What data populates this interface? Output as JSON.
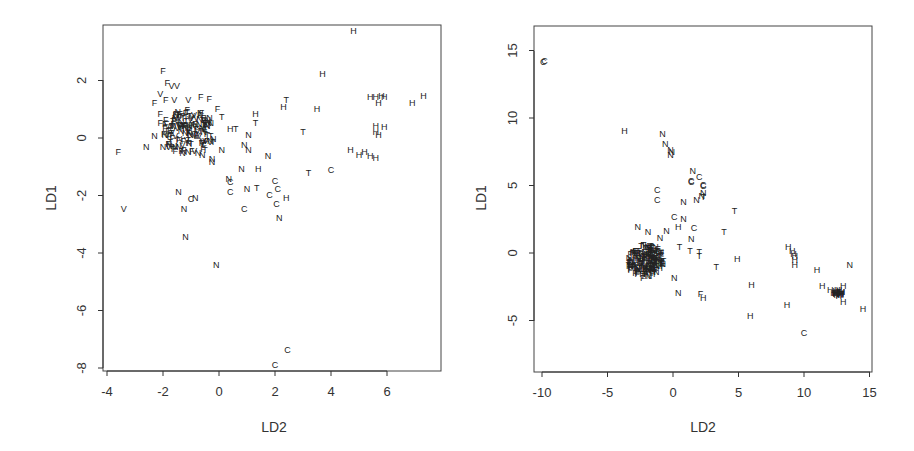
{
  "chart_data": [
    {
      "type": "scatter",
      "title": "",
      "xlabel": "LD2",
      "ylabel": "LD1",
      "xlim": [
        -4.3,
        7.8
      ],
      "ylim": [
        -8.1,
        3.9
      ],
      "xticks": [
        -4,
        -2,
        0,
        2,
        4,
        6
      ],
      "yticks": [
        -8,
        -6,
        -4,
        -2,
        0,
        2
      ],
      "grid": false,
      "legend": "none (points plotted as class letters)",
      "classes": [
        "C",
        "F",
        "H",
        "N",
        "T",
        "V"
      ],
      "points": [
        {
          "label": "H",
          "x": 4.8,
          "y": 3.7
        },
        {
          "label": "H",
          "x": 3.7,
          "y": 2.2
        },
        {
          "label": "T",
          "x": 2.4,
          "y": 1.3
        },
        {
          "label": "H",
          "x": 2.3,
          "y": 1.05
        },
        {
          "label": "H",
          "x": 3.5,
          "y": 1.0
        },
        {
          "label": "H",
          "x": 5.4,
          "y": 1.4
        },
        {
          "label": "H",
          "x": 5.6,
          "y": 1.4
        },
        {
          "label": "H",
          "x": 5.8,
          "y": 1.45
        },
        {
          "label": "H",
          "x": 5.9,
          "y": 1.4
        },
        {
          "label": "H",
          "x": 5.7,
          "y": 1.2
        },
        {
          "label": "H",
          "x": 6.9,
          "y": 1.2
        },
        {
          "label": "H",
          "x": 7.3,
          "y": 1.45
        },
        {
          "label": "H",
          "x": 5.6,
          "y": 0.4
        },
        {
          "label": "H",
          "x": 5.9,
          "y": 0.35
        },
        {
          "label": "H",
          "x": 5.6,
          "y": 0.2
        },
        {
          "label": "H",
          "x": 5.7,
          "y": 0.1
        },
        {
          "label": "H",
          "x": 4.7,
          "y": -0.45
        },
        {
          "label": "H",
          "x": 5.0,
          "y": -0.6
        },
        {
          "label": "H",
          "x": 5.2,
          "y": -0.5
        },
        {
          "label": "H",
          "x": 5.4,
          "y": -0.65
        },
        {
          "label": "H",
          "x": 5.6,
          "y": -0.7
        },
        {
          "label": "T",
          "x": 3.0,
          "y": 0.2
        },
        {
          "label": "T",
          "x": 3.2,
          "y": -1.25
        },
        {
          "label": "C",
          "x": 4.0,
          "y": -1.15
        },
        {
          "label": "H",
          "x": 1.3,
          "y": 0.8
        },
        {
          "label": "T",
          "x": 1.3,
          "y": 0.5
        },
        {
          "label": "H",
          "x": 0.4,
          "y": 0.3
        },
        {
          "label": "T",
          "x": 0.6,
          "y": 0.3
        },
        {
          "label": "N",
          "x": 1.05,
          "y": 0.1
        },
        {
          "label": "N",
          "x": 0.9,
          "y": -0.25
        },
        {
          "label": "N",
          "x": 1.05,
          "y": -0.45
        },
        {
          "label": "N",
          "x": 1.75,
          "y": -0.65
        },
        {
          "label": "N",
          "x": 0.8,
          "y": -1.1
        },
        {
          "label": "H",
          "x": 1.4,
          "y": -1.1
        },
        {
          "label": "N",
          "x": 0.35,
          "y": -1.45
        },
        {
          "label": "C",
          "x": 0.4,
          "y": -1.55
        },
        {
          "label": "C",
          "x": 0.4,
          "y": -1.9
        },
        {
          "label": "N",
          "x": 1.0,
          "y": -1.8
        },
        {
          "label": "T",
          "x": 1.35,
          "y": -1.75
        },
        {
          "label": "C",
          "x": 2.0,
          "y": -1.5
        },
        {
          "label": "C",
          "x": 2.1,
          "y": -1.8
        },
        {
          "label": "C",
          "x": 1.8,
          "y": -2.0
        },
        {
          "label": "H",
          "x": 2.4,
          "y": -2.1
        },
        {
          "label": "C",
          "x": 2.05,
          "y": -2.3
        },
        {
          "label": "C",
          "x": 0.9,
          "y": -2.5
        },
        {
          "label": "N",
          "x": 2.15,
          "y": -2.8
        },
        {
          "label": "N",
          "x": -1.45,
          "y": -1.9
        },
        {
          "label": "N",
          "x": -0.85,
          "y": -2.1
        },
        {
          "label": "C",
          "x": -1.0,
          "y": -2.15
        },
        {
          "label": "N",
          "x": -1.25,
          "y": -2.5
        },
        {
          "label": "N",
          "x": -1.2,
          "y": -3.45
        },
        {
          "label": "N",
          "x": -0.1,
          "y": -4.45
        },
        {
          "label": "C",
          "x": 2.45,
          "y": -7.4
        },
        {
          "label": "C",
          "x": 2.0,
          "y": -7.9
        },
        {
          "label": "F",
          "x": -3.6,
          "y": -0.5
        },
        {
          "label": "V",
          "x": -3.4,
          "y": -2.5
        },
        {
          "label": "N",
          "x": -2.6,
          "y": -0.35
        },
        {
          "label": "N",
          "x": -2.3,
          "y": 0.05
        },
        {
          "label": "F",
          "x": -2.0,
          "y": 2.3
        },
        {
          "label": "F",
          "x": -1.85,
          "y": 1.9
        },
        {
          "label": "V",
          "x": -1.7,
          "y": 1.8
        },
        {
          "label": "V",
          "x": -1.5,
          "y": 1.8
        },
        {
          "label": "V",
          "x": -2.1,
          "y": 1.5
        },
        {
          "label": "F",
          "x": -2.3,
          "y": 1.2
        },
        {
          "label": "F",
          "x": -1.9,
          "y": 1.3
        },
        {
          "label": "V",
          "x": -1.6,
          "y": 1.3
        },
        {
          "label": "V",
          "x": -1.1,
          "y": 1.3
        },
        {
          "label": "F",
          "x": -0.65,
          "y": 1.4
        },
        {
          "label": "F",
          "x": -0.35,
          "y": 1.35
        },
        {
          "label": "F",
          "x": -0.05,
          "y": 1.0
        },
        {
          "label": "T",
          "x": 0.1,
          "y": 0.7
        },
        {
          "label": "F",
          "x": -2.1,
          "y": 0.8
        },
        {
          "label": "F",
          "x": -2.1,
          "y": 0.5
        },
        {
          "label": "F",
          "x": -1.9,
          "y": 0.6
        },
        {
          "label": "N",
          "x": -2.0,
          "y": -0.35
        },
        {
          "label": "V",
          "x": -1.8,
          "y": -0.35
        },
        {
          "label": "N",
          "x": -0.6,
          "y": -0.6
        },
        {
          "label": "N",
          "x": -0.25,
          "y": -0.75
        },
        {
          "label": "N",
          "x": -0.25,
          "y": -0.85
        },
        {
          "label": "N",
          "x": 0.1,
          "y": -0.45
        },
        {
          "label": "N",
          "x": -1.3,
          "y": -0.55
        },
        {
          "label": "N",
          "x": -1.1,
          "y": -0.5
        }
      ],
      "clusters": [
        {
          "description": "dense overlapping cluster of F, N, V, T labels",
          "x_range": [
            -2.0,
            -0.1
          ],
          "y_range": [
            -0.6,
            1.0
          ]
        }
      ]
    },
    {
      "type": "scatter",
      "title": "",
      "xlabel": "LD2",
      "ylabel": "LD1",
      "xlim": [
        -10.6,
        15.1
      ],
      "ylim": [
        -8.7,
        16.9
      ],
      "xticks": [
        -10,
        -5,
        0,
        5,
        10,
        15
      ],
      "yticks": [
        -5,
        0,
        5,
        10,
        15
      ],
      "grid": false,
      "legend": "none (points plotted as class letters)",
      "classes": [
        "C",
        "F",
        "H",
        "N",
        "T"
      ],
      "points": [
        {
          "label": "C",
          "x": -9.9,
          "y": 14.1
        },
        {
          "label": "C",
          "x": -9.8,
          "y": 14.2
        },
        {
          "label": "H",
          "x": -3.7,
          "y": 9.0
        },
        {
          "label": "N",
          "x": -0.8,
          "y": 8.8
        },
        {
          "label": "N",
          "x": -0.6,
          "y": 8.0
        },
        {
          "label": "N",
          "x": -0.2,
          "y": 7.6
        },
        {
          "label": "N",
          "x": -0.1,
          "y": 7.4
        },
        {
          "label": "N",
          "x": -0.2,
          "y": 7.2
        },
        {
          "label": "N",
          "x": 1.5,
          "y": 6.0
        },
        {
          "label": "C",
          "x": 2.0,
          "y": 5.6
        },
        {
          "label": "C",
          "x": 1.4,
          "y": 5.3
        },
        {
          "label": "C",
          "x": 1.4,
          "y": 5.2
        },
        {
          "label": "C",
          "x": 2.3,
          "y": 5.0
        },
        {
          "label": "C",
          "x": 2.3,
          "y": 4.9
        },
        {
          "label": "N",
          "x": 2.3,
          "y": 4.4
        },
        {
          "label": "N",
          "x": 2.2,
          "y": 4.2
        },
        {
          "label": "T",
          "x": 2.3,
          "y": 4.1
        },
        {
          "label": "N",
          "x": 1.8,
          "y": 3.9
        },
        {
          "label": "C",
          "x": -1.2,
          "y": 4.6
        },
        {
          "label": "C",
          "x": -1.2,
          "y": 3.9
        },
        {
          "label": "N",
          "x": 0.8,
          "y": 3.7
        },
        {
          "label": "T",
          "x": 4.7,
          "y": 3.1
        },
        {
          "label": "C",
          "x": 0.1,
          "y": 2.6
        },
        {
          "label": "N",
          "x": 0.8,
          "y": 2.5
        },
        {
          "label": "H",
          "x": 0.4,
          "y": 1.9
        },
        {
          "label": "C",
          "x": 1.6,
          "y": 1.8
        },
        {
          "label": "T",
          "x": 3.9,
          "y": 1.5
        },
        {
          "label": "N",
          "x": -2.7,
          "y": 1.9
        },
        {
          "label": "N",
          "x": -1.9,
          "y": 1.5
        },
        {
          "label": "N",
          "x": -0.5,
          "y": 1.6
        },
        {
          "label": "N",
          "x": -1.0,
          "y": 1.1
        },
        {
          "label": "N",
          "x": 1.4,
          "y": 1.0
        },
        {
          "label": "T",
          "x": 0.5,
          "y": 0.4
        },
        {
          "label": "T",
          "x": 1.3,
          "y": 0.1
        },
        {
          "label": "T",
          "x": 2.0,
          "y": 0.0
        },
        {
          "label": "T",
          "x": 2.0,
          "y": -0.3
        },
        {
          "label": "T",
          "x": 3.3,
          "y": -1.1
        },
        {
          "label": "H",
          "x": 4.9,
          "y": -0.5
        },
        {
          "label": "F",
          "x": -3.2,
          "y": -1.1
        },
        {
          "label": "F",
          "x": -2.3,
          "y": -1.9
        },
        {
          "label": "N",
          "x": 0.1,
          "y": -1.9
        },
        {
          "label": "N",
          "x": 0.4,
          "y": -3.0
        },
        {
          "label": "F",
          "x": 2.1,
          "y": -3.1
        },
        {
          "label": "H",
          "x": 2.3,
          "y": -3.4
        },
        {
          "label": "H",
          "x": 6.0,
          "y": -2.4
        },
        {
          "label": "H",
          "x": 5.9,
          "y": -4.7
        },
        {
          "label": "H",
          "x": 8.8,
          "y": 0.4
        },
        {
          "label": "H",
          "x": 9.1,
          "y": 0.1
        },
        {
          "label": "H",
          "x": 9.2,
          "y": -0.1
        },
        {
          "label": "H",
          "x": 9.3,
          "y": -0.3
        },
        {
          "label": "H",
          "x": 9.3,
          "y": -0.6
        },
        {
          "label": "H",
          "x": 9.3,
          "y": -0.9
        },
        {
          "label": "H",
          "x": 11.0,
          "y": -1.3
        },
        {
          "label": "N",
          "x": 13.5,
          "y": -0.9
        },
        {
          "label": "H",
          "x": 11.4,
          "y": -2.5
        },
        {
          "label": "H",
          "x": 12.0,
          "y": -2.8
        },
        {
          "label": "H",
          "x": 12.4,
          "y": -3.0
        },
        {
          "label": "H",
          "x": 12.7,
          "y": -3.1
        },
        {
          "label": "H",
          "x": 13.0,
          "y": -2.5
        },
        {
          "label": "H",
          "x": 13.0,
          "y": -3.7
        },
        {
          "label": "H",
          "x": 8.7,
          "y": -3.9
        },
        {
          "label": "H",
          "x": 14.5,
          "y": -4.2
        },
        {
          "label": "C",
          "x": 10.0,
          "y": -6.0
        }
      ],
      "clusters": [
        {
          "description": "dense overlapping cluster of N, F, T labels",
          "x_range": [
            -3.5,
            -0.7
          ],
          "y_range": [
            -1.8,
            0.6
          ]
        },
        {
          "description": "tight cluster of H labels",
          "x_range": [
            12.2,
            13.0
          ],
          "y_range": [
            -3.3,
            -2.8
          ]
        }
      ]
    }
  ],
  "plots": [
    {
      "xlabel": "LD2",
      "ylabel": "LD1",
      "xtick_labels": [
        "-4",
        "-2",
        "0",
        "2",
        "4",
        "6"
      ],
      "ytick_labels": [
        "2",
        "0",
        "-2",
        "-4",
        "-6",
        "-8"
      ]
    },
    {
      "xlabel": "LD2",
      "ylabel": "LD1",
      "xtick_labels": [
        "-10",
        "-5",
        "0",
        "5",
        "10",
        "15"
      ],
      "ytick_labels": [
        "15",
        "10",
        "5",
        "0",
        "-5"
      ]
    }
  ]
}
